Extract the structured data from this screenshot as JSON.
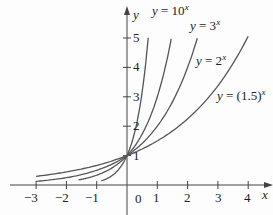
{
  "chart_data": {
    "type": "line",
    "title": "",
    "xlabel": "x",
    "ylabel": "y",
    "xlim": [
      -3,
      4
    ],
    "ylim": [
      0,
      5
    ],
    "x_ticks": [
      "-3",
      "-2",
      "-1",
      "0",
      "1",
      "2",
      "3",
      "4"
    ],
    "y_ticks": [
      "1",
      "2",
      "3",
      "4",
      "5"
    ],
    "grid": false,
    "legend": "inline labels",
    "series": [
      {
        "name": "y = 10^x",
        "base": 10,
        "x_range": [
          -0.85,
          0.7
        ],
        "label": "y = 10",
        "exp": "x"
      },
      {
        "name": "y = 3^x",
        "base": 3,
        "x_range": [
          -1.6,
          1.46
        ],
        "label": "y = 3",
        "exp": "x"
      },
      {
        "name": "y = 2^x",
        "base": 2,
        "x_range": [
          -3,
          2.32
        ],
        "label": "y = 2",
        "exp": "x"
      },
      {
        "name": "y = (1.5)^x",
        "base": 1.5,
        "x_range": [
          -3,
          4.0
        ],
        "label": "y = (1.5)",
        "exp": "x"
      }
    ]
  },
  "axes": {
    "x_label": "x",
    "y_label": "y",
    "origin_label": "0"
  }
}
